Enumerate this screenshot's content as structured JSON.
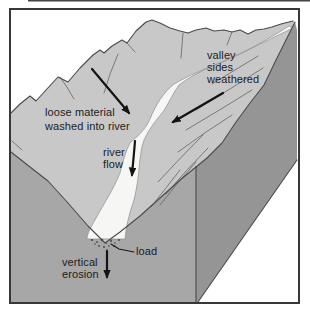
{
  "diagram": {
    "labels": {
      "loose_material": "loose material\nwashed into river",
      "valley_sides": "valley\nsides\nweathered",
      "river_flow": "river\nflow",
      "load": "load",
      "vertical_erosion": "vertical\nerosion"
    },
    "colors": {
      "background": "#ffffff",
      "top_surface": "#c8c8c8",
      "front_face": "#a7a7a7",
      "right_face": "#959595",
      "river": "#f6f6f4",
      "outline": "#4a4a4a",
      "arrow": "#141414",
      "text": "#1c1c1c",
      "frame_border": "#383838"
    }
  }
}
